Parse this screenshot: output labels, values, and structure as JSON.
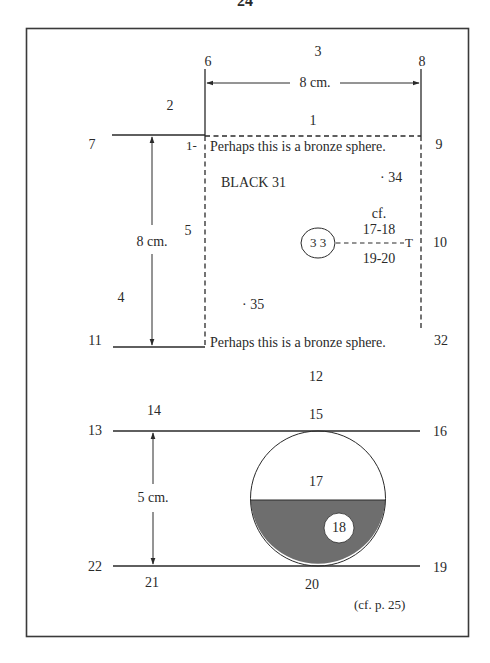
{
  "page": {
    "number": "24",
    "cross_reference": "(cf. p. 25)"
  },
  "colors": {
    "ink": "#2a2a2a",
    "shade": "#6e6e6e",
    "frame": "#3a3a3a",
    "background": "#ffffff"
  },
  "upper_figure": {
    "dimension_horizontal": "8 cm.",
    "dimension_vertical": "8 cm.",
    "sphere_note_top": "Perhaps this is a bronze sphere.",
    "sphere_note_bottom": "Perhaps this is a bronze sphere.",
    "block_label": "BLACK 31",
    "circle_label": "3 3",
    "circle_endpoint": "T",
    "crossref_top": "cf.",
    "crossref_range_1": "17-18",
    "crossref_range_2": "19-20",
    "point_labels": {
      "p1": "1",
      "p1_dash": "1-",
      "p2": "2",
      "p3": "3",
      "p4": "4",
      "p5": "5",
      "p6": "6",
      "p7": "7",
      "p8": "8",
      "p9": "9",
      "p10": "10",
      "p11": "11",
      "p12": "12",
      "p32": "32",
      "p34": "· 34",
      "p35": "· 35"
    }
  },
  "lower_figure": {
    "dimension_vertical": "5 cm.",
    "point_labels": {
      "p13": "13",
      "p14": "14",
      "p15": "15",
      "p16": "16",
      "p17": "17",
      "p18": "18",
      "p19": "19",
      "p20": "20",
      "p21": "21",
      "p22": "22"
    }
  }
}
